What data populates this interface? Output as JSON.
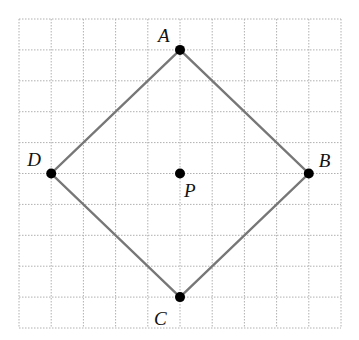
{
  "diagram": {
    "type": "grid-figure",
    "grid": {
      "cols": 10,
      "rows": 10,
      "origin_x": 19,
      "origin_y": 19,
      "cell_w": 32.2,
      "cell_h": 30.9,
      "line_color": "#b0b0b0",
      "style": "dotted"
    },
    "shape": {
      "name": "square ABCD",
      "stroke_color": "#777777",
      "vertices": [
        "A",
        "B",
        "C",
        "D"
      ]
    },
    "points": [
      {
        "id": "A",
        "label": "A",
        "col": 5,
        "row": 1,
        "label_dx": -22,
        "label_dy": -8
      },
      {
        "id": "B",
        "label": "B",
        "col": 9,
        "row": 5,
        "label_dx": 10,
        "label_dy": -7
      },
      {
        "id": "C",
        "label": "C",
        "col": 5,
        "row": 9,
        "label_dx": -26,
        "label_dy": 28
      },
      {
        "id": "D",
        "label": "D",
        "col": 1,
        "row": 5,
        "label_dx": -24,
        "label_dy": -8
      },
      {
        "id": "P",
        "label": "P",
        "col": 5,
        "row": 5,
        "label_dx": 4,
        "label_dy": 23
      }
    ]
  }
}
